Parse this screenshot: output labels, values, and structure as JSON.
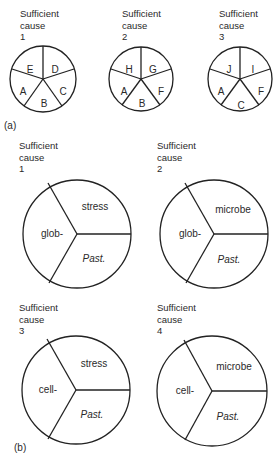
{
  "panel_a": {
    "tag": "(a)",
    "causes": [
      {
        "title": "Sufficient",
        "subtitle": "cause",
        "number": "1",
        "segments": [
          "E",
          "D",
          "C",
          "B",
          "A"
        ]
      },
      {
        "title": "Sufficient",
        "subtitle": "cause",
        "number": "2",
        "segments": [
          "H",
          "G",
          "F",
          "B",
          "A"
        ]
      },
      {
        "title": "Sufficient",
        "subtitle": "cause",
        "number": "3",
        "segments": [
          "J",
          "I",
          "F",
          "C",
          "A"
        ]
      }
    ]
  },
  "panel_b": {
    "tag": "(b)",
    "causes": [
      {
        "title": "Sufficient",
        "subtitle": "cause",
        "number": "1",
        "segments": [
          "stress",
          "Past.",
          "glob-"
        ]
      },
      {
        "title": "Sufficient",
        "subtitle": "cause",
        "number": "2",
        "segments": [
          "microbe",
          "Past.",
          "glob-"
        ]
      },
      {
        "title": "Sufficient",
        "subtitle": "cause",
        "number": "3",
        "segments": [
          "stress",
          "Past.",
          "cell-"
        ]
      },
      {
        "title": "Sufficient",
        "subtitle": "cause",
        "number": "4",
        "segments": [
          "microbe",
          "Past.",
          "cell-"
        ]
      }
    ]
  },
  "colors": {
    "stroke": "#222222",
    "text": "#2a2a2a",
    "background": "#ffffff"
  }
}
